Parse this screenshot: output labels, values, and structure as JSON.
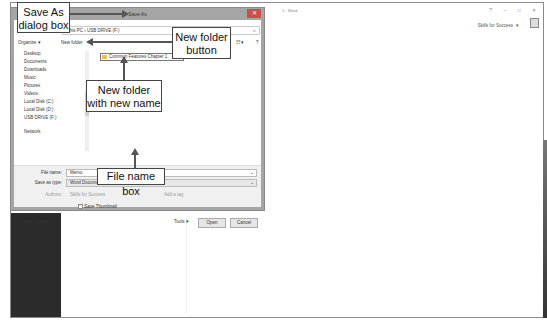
{
  "word": {
    "title": "1 - Word",
    "window_controls": [
      "?",
      "–",
      "□",
      "✕"
    ],
    "account_name": "Skills for Success",
    "account_dropdown": "▾"
  },
  "dialog": {
    "title": "Save As",
    "close": "✕",
    "address": {
      "path": "This PC  ›  USB DRIVE (F:)",
      "dropdown": "⌄",
      "search_icon": "⌕"
    },
    "toolbar": {
      "organize": "Organize ▾",
      "new_folder": "New folder",
      "view": "☷ ▾",
      "help": "?"
    },
    "nav_items": [
      {
        "label": "Desktop",
        "icon": "desktop-icon"
      },
      {
        "label": "Documents",
        "icon": "documents-icon"
      },
      {
        "label": "Downloads",
        "icon": "downloads-icon"
      },
      {
        "label": "Music",
        "icon": "music-icon"
      },
      {
        "label": "Pictures",
        "icon": "pictures-icon"
      },
      {
        "label": "Videos",
        "icon": "videos-icon"
      },
      {
        "label": "Local Disk (C:)",
        "icon": "drive-icon"
      },
      {
        "label": "Local Disk (D:)",
        "icon": "drive-icon"
      },
      {
        "label": "USB DRIVE (F:)",
        "icon": "usb-icon"
      },
      {
        "label": "Network",
        "icon": "network-icon"
      }
    ],
    "new_folder_name": "Common Features Chapter 1",
    "file_name_label": "File name:",
    "file_name_value": "Memo",
    "save_as_type_label": "Save as type:",
    "save_as_type_value": "Word Document",
    "authors_label": "Authors:",
    "authors_value": "Skills for Success",
    "tags_label": "Tags:",
    "tags_value": "Add a tag",
    "save_thumbnail_label": "Save Thumbnail",
    "hide_folders": "Hide Folders",
    "tools": "Tools ▾",
    "open_button": "Open",
    "cancel_button": "Cancel"
  },
  "callouts": {
    "save_as_dialog": "Save As dialog box",
    "new_folder_button": "New folder button",
    "new_folder_name": "New folder with new name",
    "file_name_box": "File name box"
  }
}
